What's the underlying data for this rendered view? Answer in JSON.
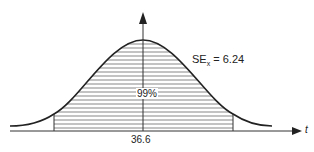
{
  "diagram": {
    "type": "normal-distribution-curve",
    "annotation": {
      "se_label": "SE",
      "se_subscript": "x",
      "se_equals": " = ",
      "se_value": "6.24"
    },
    "shaded_area_label": "99%",
    "mean_label": "36.6",
    "x_axis_label": "t",
    "colors": {
      "line": "#222222",
      "hatch": "#555555",
      "background": "#ffffff"
    }
  }
}
